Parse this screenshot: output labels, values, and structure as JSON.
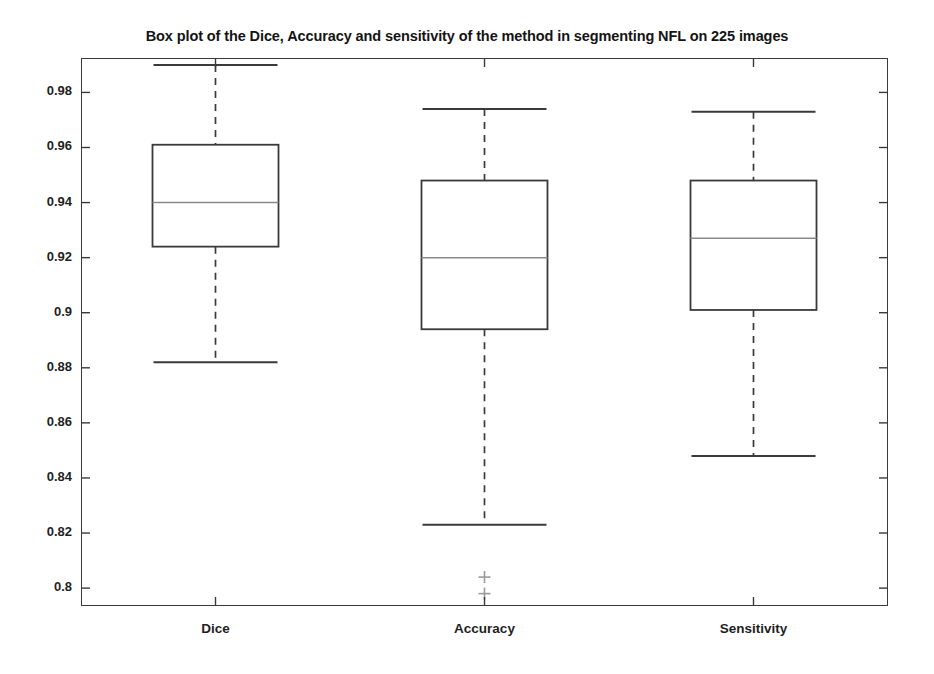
{
  "chart_data": {
    "type": "box",
    "title": "Box plot of the Dice, Accuracy and sensitivity of the method in segmenting NFL on 225 images",
    "xlabel": "",
    "ylabel": "",
    "ylim": [
      0.7935,
      0.9925
    ],
    "grid": false,
    "legend": "none",
    "categories": [
      "Dice",
      "Accuracy",
      "Sensitivity"
    ],
    "yticks": [
      "0.8",
      "0.82",
      "0.84",
      "0.86",
      "0.88",
      "0.9",
      "0.92",
      "0.94",
      "0.96",
      "0.98"
    ],
    "ytick_values": [
      0.8,
      0.82,
      0.84,
      0.86,
      0.88,
      0.9,
      0.92,
      0.94,
      0.96,
      0.98
    ],
    "boxes": [
      {
        "label": "Dice",
        "whisker_high": 0.99,
        "q3": 0.961,
        "median": 0.94,
        "q1": 0.924,
        "whisker_low": 0.882,
        "outliers": []
      },
      {
        "label": "Accuracy",
        "whisker_high": 0.974,
        "q3": 0.948,
        "median": 0.92,
        "q1": 0.894,
        "whisker_low": 0.823,
        "outliers": [
          0.804,
          0.798
        ]
      },
      {
        "label": "Sensitivity",
        "whisker_high": 0.973,
        "q3": 0.948,
        "median": 0.927,
        "q1": 0.901,
        "whisker_low": 0.848,
        "outliers": []
      }
    ],
    "colors": {
      "box_edge": "#3a3a3a",
      "median": "#8a8a8a",
      "whisker": "#3a3a3a",
      "outlier": "#9a9a9a",
      "axis": "#3a3a3a",
      "background": "#ffffff",
      "text": "#1a1a1a"
    }
  }
}
